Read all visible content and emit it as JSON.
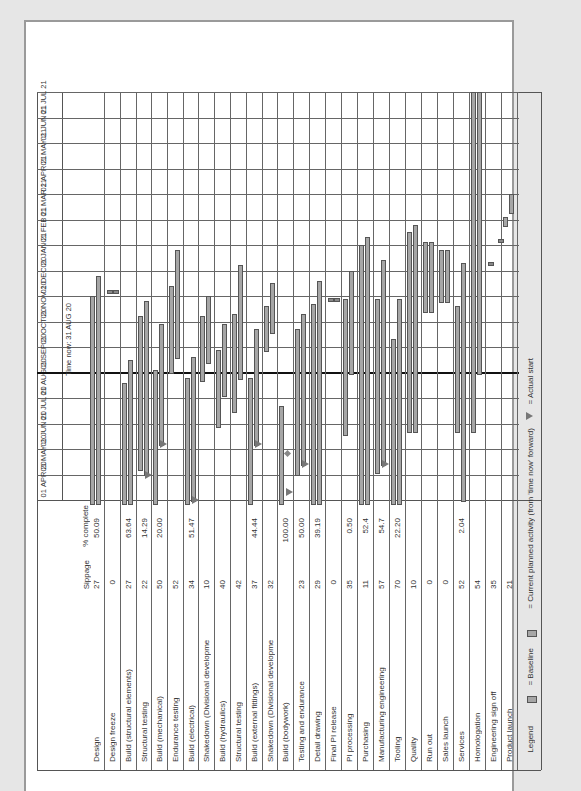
{
  "chart_data": {
    "type": "gantt",
    "orientation_note": "chart printed rotated 90 degrees counter-clockwise",
    "timeline": {
      "months": [
        {
          "day": "01",
          "month": "APR",
          "year": "20"
        },
        {
          "day": "01",
          "month": "MAY",
          "year": "20"
        },
        {
          "day": "01",
          "month": "JUN",
          "year": "20"
        },
        {
          "day": "01",
          "month": "JUL",
          "year": "20"
        },
        {
          "day": "01",
          "month": "AUG",
          "year": "20"
        },
        {
          "day": "01",
          "month": "SEP",
          "year": "20"
        },
        {
          "day": "01",
          "month": "OCT",
          "year": "20"
        },
        {
          "day": "01",
          "month": "NOV",
          "year": "20"
        },
        {
          "day": "01",
          "month": "DEC",
          "year": "20"
        },
        {
          "day": "01",
          "month": "JAN",
          "year": "21"
        },
        {
          "day": "01",
          "month": "FEB",
          "year": "21"
        },
        {
          "day": "01",
          "month": "MAR",
          "year": "21"
        },
        {
          "day": "01",
          "month": "APR",
          "year": "21"
        },
        {
          "day": "01",
          "month": "MAY",
          "year": "21"
        },
        {
          "day": "01",
          "month": "JUN",
          "year": "21"
        },
        {
          "day": "01",
          "month": "JUL",
          "year": "21"
        }
      ],
      "time_now_label": "Time now: 31 AUG 20",
      "time_now_month_offset": 5.0
    },
    "columns": {
      "task": "",
      "slippage": "Sippage",
      "percent_complete": "% complete"
    },
    "rows": [
      {
        "task": "Design",
        "slippage": "27",
        "complete": "50.09",
        "x": 88,
        "bars": [
          {
            "kind": "baseline",
            "start": -0.1,
            "end": 8.0
          },
          {
            "kind": "current",
            "start": -0.1,
            "end": 8.8
          }
        ]
      },
      {
        "task": "Design freeze",
        "slippage": "0",
        "complete": "",
        "x": 104,
        "bars": [],
        "milestones": [
          {
            "at": 8.2,
            "dx": 0
          },
          {
            "at": 8.2,
            "dx": 6
          }
        ]
      },
      {
        "task": "Build (structural elements)",
        "slippage": "27",
        "complete": "63.64",
        "x": 120,
        "bars": [
          {
            "kind": "baseline",
            "start": -0.1,
            "end": 4.6
          },
          {
            "kind": "current",
            "start": -0.1,
            "end": 5.5
          }
        ]
      },
      {
        "task": "Structural testing",
        "slippage": "22",
        "complete": "14.29",
        "x": 136,
        "bars": [
          {
            "kind": "baseline",
            "start": 1.2,
            "end": 7.2
          },
          {
            "kind": "current",
            "start": 1.0,
            "end": 7.8
          }
        ],
        "actual_start": 1.0
      },
      {
        "task": "Build (mechanical)",
        "slippage": "50",
        "complete": "20.00",
        "x": 151,
        "bars": [
          {
            "kind": "baseline",
            "start": -0.1,
            "end": 5.1
          },
          {
            "kind": "current",
            "start": 2.2,
            "end": 6.9
          }
        ],
        "actual_start": 2.2
      },
      {
        "task": "Endurance testing",
        "slippage": "52",
        "complete": "",
        "x": 167,
        "bars": [
          {
            "kind": "baseline",
            "start": 5.0,
            "end": 8.4
          },
          {
            "kind": "current",
            "start": 5.6,
            "end": 9.8
          }
        ]
      },
      {
        "task": "Build (electrical)",
        "slippage": "34",
        "complete": "51.47",
        "x": 183,
        "bars": [
          {
            "kind": "baseline",
            "start": -0.1,
            "end": 4.8
          },
          {
            "kind": "current",
            "start": 0.0,
            "end": 5.6
          }
        ],
        "actual_start": 0.0
      },
      {
        "task": "Shakedown (Divisional development)",
        "slippage": "10",
        "complete": "",
        "x": 198,
        "bars": [
          {
            "kind": "baseline",
            "start": 4.7,
            "end": 7.2
          },
          {
            "kind": "current",
            "start": 5.4,
            "end": 8.0
          }
        ]
      },
      {
        "task": "Build (hydraulics)",
        "slippage": "40",
        "complete": "",
        "x": 214,
        "bars": [
          {
            "kind": "baseline",
            "start": 2.9,
            "end": 5.9
          },
          {
            "kind": "current",
            "start": 4.1,
            "end": 6.9
          }
        ]
      },
      {
        "task": "Structural testing",
        "slippage": "42",
        "complete": "",
        "x": 230,
        "bars": [
          {
            "kind": "baseline",
            "start": 3.5,
            "end": 7.3
          },
          {
            "kind": "current",
            "start": 4.8,
            "end": 9.2
          }
        ]
      },
      {
        "task": "Build (external fittings)",
        "slippage": "37",
        "complete": "44.44",
        "x": 246,
        "bars": [
          {
            "kind": "baseline",
            "start": -0.1,
            "end": 4.8
          },
          {
            "kind": "current",
            "start": 2.2,
            "end": 6.7
          }
        ],
        "actual_start": 2.2
      },
      {
        "task": "Shakedown (Divisional development)",
        "slippage": "32",
        "complete": "",
        "x": 262,
        "bars": [
          {
            "kind": "baseline",
            "start": 5.9,
            "end": 7.6
          },
          {
            "kind": "current",
            "start": 6.6,
            "end": 8.5
          }
        ]
      },
      {
        "task": "Build (bodywork)",
        "slippage": "",
        "complete": "100.00",
        "x": 277,
        "bars": [
          {
            "kind": "baseline",
            "start": -0.1,
            "end": 3.7
          }
        ],
        "actual_start": 0.3,
        "milestones": [
          {
            "at": 1.8,
            "dx": 8,
            "diamond": true
          }
        ]
      },
      {
        "task": "Testing and endurance",
        "slippage": "23",
        "complete": "50.00",
        "x": 293,
        "bars": [
          {
            "kind": "baseline",
            "start": 1.0,
            "end": 6.7
          },
          {
            "kind": "current",
            "start": 1.4,
            "end": 7.3
          }
        ],
        "actual_start": 1.4
      },
      {
        "task": "Detail drawing",
        "slippage": "29",
        "complete": "39.19",
        "x": 309,
        "bars": [
          {
            "kind": "baseline",
            "start": -0.1,
            "end": 7.7
          },
          {
            "kind": "current",
            "start": -0.1,
            "end": 8.6
          }
        ]
      },
      {
        "task": "Final PI release",
        "slippage": "0",
        "complete": "",
        "x": 325,
        "bars": [],
        "milestones": [
          {
            "at": 7.9,
            "dx": 0
          },
          {
            "at": 7.9,
            "dx": 6
          }
        ]
      },
      {
        "task": "PI processing",
        "slippage": "35",
        "complete": "0.50",
        "x": 341,
        "bars": [
          {
            "kind": "baseline",
            "start": 2.6,
            "end": 7.9
          },
          {
            "kind": "current",
            "start": 5.0,
            "end": 9.0
          }
        ]
      },
      {
        "task": "Purchasing",
        "slippage": "11",
        "complete": "52.4",
        "x": 357,
        "bars": [
          {
            "kind": "baseline",
            "start": -0.1,
            "end": 10.0
          },
          {
            "kind": "current",
            "start": -0.1,
            "end": 10.3
          }
        ]
      },
      {
        "task": "Manufacturing engineering",
        "slippage": "57",
        "complete": "54.7",
        "x": 373,
        "bars": [
          {
            "kind": "baseline",
            "start": 1.1,
            "end": 7.9
          },
          {
            "kind": "current",
            "start": 1.4,
            "end": 9.4
          }
        ],
        "actual_start": 1.4
      },
      {
        "task": "Tooling",
        "slippage": "70",
        "complete": "22.20",
        "x": 389,
        "bars": [
          {
            "kind": "baseline",
            "start": -0.1,
            "end": 6.3
          },
          {
            "kind": "current",
            "start": -0.1,
            "end": 7.9
          }
        ]
      },
      {
        "task": "Quality",
        "slippage": "10",
        "complete": "",
        "x": 405,
        "bars": [
          {
            "kind": "baseline",
            "start": 2.7,
            "end": 10.5
          },
          {
            "kind": "current",
            "start": 2.7,
            "end": 10.8
          }
        ]
      },
      {
        "task": "Run out",
        "slippage": "0",
        "complete": "",
        "x": 421,
        "bars": [
          {
            "kind": "baseline",
            "start": 7.4,
            "end": 10.1
          },
          {
            "kind": "current",
            "start": 7.4,
            "end": 10.1
          }
        ]
      },
      {
        "task": "Sales launch",
        "slippage": "0",
        "complete": "",
        "x": 437,
        "bars": [
          {
            "kind": "baseline",
            "start": 7.8,
            "end": 9.8
          },
          {
            "kind": "current",
            "start": 7.8,
            "end": 9.8
          }
        ]
      },
      {
        "task": "Services",
        "slippage": "52",
        "complete": "2.04",
        "x": 453,
        "bars": [
          {
            "kind": "baseline",
            "start": 2.7,
            "end": 7.6
          },
          {
            "kind": "current",
            "start": 0.0,
            "end": 9.3
          }
        ]
      },
      {
        "task": "Homologation",
        "slippage": "54",
        "complete": "",
        "x": 469,
        "bars": [
          {
            "kind": "baseline",
            "start": 2.7,
            "end": 16.0
          },
          {
            "kind": "current",
            "start": 5.0,
            "end": 16.0
          }
        ]
      },
      {
        "task": "Engineering sign off",
        "slippage": "35",
        "complete": "",
        "x": 485,
        "bars": [],
        "milestones": [
          {
            "at": 9.3,
            "dx": 0
          }
        ]
      },
      {
        "task": "Product launch",
        "slippage": "21",
        "complete": "",
        "x": 501,
        "bars": [
          {
            "kind": "baseline",
            "start": 10.8,
            "end": 11.1
          },
          {
            "kind": "current",
            "start": 11.3,
            "end": 12.0
          }
        ],
        "milestones": [
          {
            "at": 10.2,
            "dx": -6
          }
        ]
      }
    ]
  },
  "legend": {
    "title": "Legend",
    "baseline": "= Baseline",
    "current": "= Current planned activity (from 'time now' forward)",
    "actual_start": "= Actual start"
  }
}
